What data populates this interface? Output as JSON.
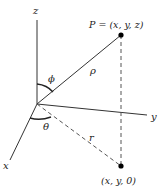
{
  "diagram": {
    "axes": {
      "x_label": "x",
      "y_label": "y",
      "z_label": "z"
    },
    "points": {
      "P_label": "P = (x, y, z)",
      "projection_label": "(x, y, 0)"
    },
    "segments": {
      "rho_label": "ρ",
      "r_label": "r"
    },
    "angles": {
      "phi_label": "ϕ",
      "theta_label": "θ"
    },
    "colors": {
      "line": "#333333",
      "dashed": "#555555",
      "point": "#000000"
    }
  }
}
